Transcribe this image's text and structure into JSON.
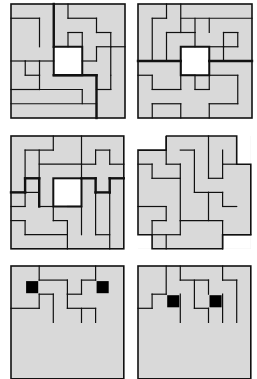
{
  "figure": {
    "colors": {
      "tile_fill": "#d9d9d9",
      "line": "#111111",
      "hole": "#ffffff",
      "blocked": "#000000"
    },
    "panels": [
      {
        "id": "p1",
        "x": 11,
        "y": 4,
        "cell": 14.25,
        "hole": [
          3,
          3,
          2,
          2
        ],
        "thin": [
          [
            3,
            0,
            3,
            3
          ],
          [
            4,
            0,
            4,
            1
          ],
          [
            4,
            1,
            6,
            1
          ],
          [
            6,
            1,
            6,
            2
          ],
          [
            6,
            2,
            7,
            2
          ],
          [
            7,
            2,
            7,
            3
          ],
          [
            7,
            3,
            8,
            3
          ],
          [
            0,
            1,
            2,
            1
          ],
          [
            2,
            1,
            2,
            3
          ],
          [
            1,
            4,
            2,
            4
          ],
          [
            0,
            4,
            1,
            4
          ],
          [
            1,
            4,
            1,
            5
          ],
          [
            1,
            5,
            2,
            5
          ],
          [
            2,
            5,
            2,
            4
          ],
          [
            2,
            4,
            3,
            4
          ],
          [
            4,
            2,
            4,
            3
          ],
          [
            4,
            2,
            5,
            2
          ],
          [
            5,
            2,
            5,
            3
          ],
          [
            5,
            4,
            6,
            4
          ],
          [
            6,
            4,
            6,
            3
          ],
          [
            6,
            3,
            7,
            3
          ],
          [
            7,
            3,
            7,
            5
          ],
          [
            5,
            5,
            6,
            5
          ],
          [
            6,
            5,
            6,
            6
          ],
          [
            6,
            6,
            7,
            6
          ],
          [
            7,
            5,
            7,
            6
          ],
          [
            0,
            6,
            2,
            6
          ],
          [
            2,
            6,
            2,
            5
          ],
          [
            2,
            6,
            5,
            6
          ],
          [
            5,
            6,
            5,
            7
          ],
          [
            0,
            7,
            6,
            7
          ],
          [
            6,
            7,
            6,
            8
          ]
        ],
        "thick": [
          [
            3,
            0,
            3,
            3
          ],
          [
            3,
            5,
            6,
            5
          ],
          [
            6,
            5,
            6,
            8
          ]
        ]
      },
      {
        "id": "p2",
        "x": 138,
        "y": 4,
        "cell": 14.25,
        "hole": [
          3,
          3,
          2,
          2
        ],
        "thin": [
          [
            2,
            0,
            2,
            1
          ],
          [
            2,
            1,
            1,
            1
          ],
          [
            1,
            1,
            1,
            4
          ],
          [
            3,
            0,
            3,
            2
          ],
          [
            3,
            1,
            8,
            1
          ],
          [
            3,
            2,
            2,
            2
          ],
          [
            2,
            2,
            2,
            4
          ],
          [
            4,
            1,
            4,
            2
          ],
          [
            4,
            2,
            3,
            2
          ],
          [
            4,
            2,
            4,
            3
          ],
          [
            5,
            3,
            6,
            3
          ],
          [
            6,
            3,
            6,
            2
          ],
          [
            5,
            1,
            5,
            2
          ],
          [
            6,
            2,
            7,
            2
          ],
          [
            7,
            2,
            7,
            3
          ],
          [
            7,
            3,
            6,
            3
          ],
          [
            6,
            3,
            6,
            4
          ],
          [
            6,
            4,
            7,
            4
          ],
          [
            0,
            5,
            1,
            5
          ],
          [
            1,
            5,
            1,
            6
          ],
          [
            1,
            6,
            3,
            6
          ],
          [
            3,
            6,
            3,
            4
          ],
          [
            3,
            5,
            4,
            5
          ],
          [
            4,
            5,
            4,
            6
          ],
          [
            4,
            6,
            5,
            6
          ],
          [
            5,
            6,
            5,
            5
          ],
          [
            5,
            5,
            7,
            5
          ],
          [
            7,
            5,
            7,
            7
          ],
          [
            7,
            7,
            5,
            7
          ],
          [
            5,
            7,
            5,
            8
          ],
          [
            1,
            7,
            3,
            7
          ],
          [
            3,
            7,
            3,
            8
          ],
          [
            1,
            7,
            1,
            8
          ]
        ],
        "thick": [
          [
            0,
            4,
            3,
            4
          ],
          [
            5,
            4,
            8,
            4
          ]
        ]
      },
      {
        "id": "p3",
        "x": 11,
        "y": 136,
        "cell": 14.1,
        "hole": [
          3,
          3,
          2,
          2
        ],
        "thin": [
          [
            3,
            0,
            3,
            1
          ],
          [
            3,
            1,
            1,
            1
          ],
          [
            1,
            1,
            1,
            3
          ],
          [
            1,
            3,
            2,
            3
          ],
          [
            2,
            3,
            2,
            1
          ],
          [
            2,
            2,
            5,
            2
          ],
          [
            5,
            0,
            5,
            3
          ],
          [
            6,
            1,
            7,
            1
          ],
          [
            6,
            1,
            6,
            2
          ],
          [
            7,
            1,
            7,
            2
          ],
          [
            7,
            2,
            8,
            2
          ],
          [
            5,
            2,
            6,
            2
          ],
          [
            2,
            4,
            0,
            4
          ],
          [
            1,
            4,
            1,
            5
          ],
          [
            1,
            5,
            0,
            5
          ],
          [
            2,
            5,
            3,
            5
          ],
          [
            3,
            5,
            3,
            6
          ],
          [
            3,
            6,
            4,
            6
          ],
          [
            4,
            6,
            4,
            8
          ],
          [
            4,
            5,
            5,
            5
          ],
          [
            5,
            5,
            5,
            7
          ],
          [
            6,
            3,
            6,
            7
          ],
          [
            6,
            7,
            7,
            7
          ],
          [
            7,
            4,
            7,
            8
          ],
          [
            1,
            6,
            1,
            7
          ],
          [
            1,
            7,
            4,
            7
          ],
          [
            0,
            6,
            1,
            6
          ]
        ],
        "thick": [
          [
            0,
            4,
            1,
            4
          ],
          [
            1,
            4,
            1,
            3
          ],
          [
            1,
            3,
            2,
            3
          ],
          [
            2,
            3,
            2,
            5
          ],
          [
            5,
            3,
            6,
            3
          ],
          [
            6,
            3,
            6,
            4
          ],
          [
            6,
            4,
            7,
            4
          ],
          [
            7,
            4,
            7,
            3
          ],
          [
            7,
            3,
            8,
            3
          ]
        ]
      },
      {
        "id": "p4",
        "x": 138,
        "y": 136,
        "cell": 14.1,
        "hole": null,
        "thin": [
          [
            2,
            0,
            2,
            2
          ],
          [
            2,
            2,
            3,
            2
          ],
          [
            3,
            2,
            3,
            6
          ],
          [
            3,
            1,
            4,
            1
          ],
          [
            4,
            1,
            4,
            4
          ],
          [
            5,
            0,
            5,
            3
          ],
          [
            5,
            3,
            6,
            3
          ],
          [
            6,
            3,
            6,
            2
          ],
          [
            6,
            2,
            7,
            2
          ],
          [
            6,
            1,
            6,
            2
          ],
          [
            0,
            2,
            1,
            2
          ],
          [
            1,
            2,
            1,
            3
          ],
          [
            1,
            3,
            3,
            3
          ],
          [
            4,
            4,
            5,
            4
          ],
          [
            5,
            4,
            5,
            6
          ],
          [
            5,
            4,
            6,
            4
          ],
          [
            6,
            4,
            6,
            5
          ],
          [
            0,
            5,
            2,
            5
          ],
          [
            2,
            5,
            2,
            6
          ],
          [
            1,
            6,
            2,
            6
          ],
          [
            1,
            6,
            1,
            7
          ],
          [
            1,
            7,
            3,
            7
          ],
          [
            3,
            6,
            3,
            7
          ],
          [
            3,
            6,
            6,
            6
          ],
          [
            6,
            5,
            7,
            5
          ],
          [
            6,
            6,
            6,
            8
          ],
          [
            6,
            7,
            8,
            7
          ],
          [
            2,
            7,
            2,
            8
          ]
        ],
        "thick": []
      },
      {
        "id": "p5",
        "x": 11,
        "y": 266,
        "cell": 14.1,
        "hole": null,
        "blocked": [
          [
            1,
            1
          ],
          [
            6,
            1
          ]
        ],
        "thin": [
          [
            2,
            0,
            2,
            1
          ],
          [
            2,
            1,
            4,
            1
          ],
          [
            4,
            1,
            4,
            2
          ],
          [
            4,
            2,
            5,
            2
          ],
          [
            5,
            2,
            5,
            1
          ],
          [
            5,
            1,
            6,
            1
          ],
          [
            6,
            0,
            6,
            1
          ],
          [
            2,
            2,
            3,
            2
          ],
          [
            3,
            2,
            3,
            4
          ],
          [
            4,
            2,
            4,
            3
          ],
          [
            4,
            3,
            6,
            3
          ],
          [
            6,
            3,
            6,
            4
          ],
          [
            0,
            3,
            2,
            3
          ],
          [
            2,
            3,
            2,
            2
          ],
          [
            5,
            3,
            5,
            4
          ]
        ],
        "thick": []
      },
      {
        "id": "p6",
        "x": 138,
        "y": 266,
        "cell": 14.1,
        "hole": null,
        "blocked": [
          [
            2,
            2
          ],
          [
            5,
            2
          ]
        ],
        "thin": [
          [
            2,
            0,
            2,
            2
          ],
          [
            3,
            0,
            3,
            1
          ],
          [
            3,
            1,
            5,
            1
          ],
          [
            5,
            1,
            5,
            2
          ],
          [
            4,
            1,
            4,
            3
          ],
          [
            4,
            3,
            5,
            3
          ],
          [
            5,
            3,
            5,
            4
          ],
          [
            6,
            0,
            6,
            1
          ],
          [
            6,
            1,
            7,
            1
          ],
          [
            7,
            1,
            7,
            4
          ],
          [
            1,
            2,
            2,
            2
          ],
          [
            1,
            2,
            1,
            3
          ],
          [
            0,
            3,
            1,
            3
          ],
          [
            3,
            2,
            3,
            4
          ],
          [
            6,
            2,
            6,
            4
          ]
        ],
        "thick": []
      }
    ]
  }
}
